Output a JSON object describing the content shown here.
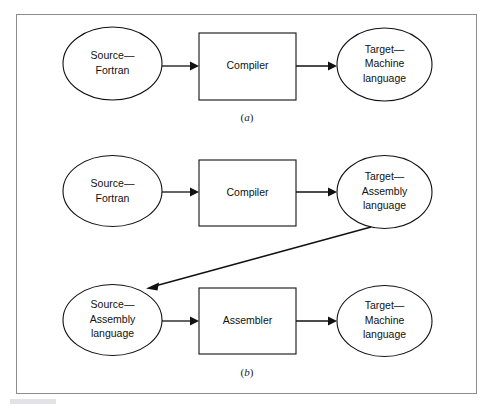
{
  "figure": {
    "background_color": "#ffffff",
    "frame_color": "#8c8c90",
    "stroke_color": "#111111",
    "panels": [
      {
        "id": "panel-a",
        "caption_open": "(",
        "caption_letter": "a",
        "caption_close": ")",
        "nodes": [
          {
            "id": "a-source",
            "shape": "ellipse",
            "role": "source",
            "lines": [
              "Source—",
              "Fortran"
            ]
          },
          {
            "id": "a-processor",
            "shape": "rectangle",
            "role": "translator",
            "lines": [
              "Compiler"
            ]
          },
          {
            "id": "a-target",
            "shape": "ellipse",
            "role": "target",
            "lines": [
              "Target—",
              "Machine",
              "language"
            ]
          }
        ],
        "edges": [
          {
            "id": "a-edge-1",
            "from": "a-source",
            "to": "a-processor",
            "style": "arrow"
          },
          {
            "id": "a-edge-2",
            "from": "a-processor",
            "to": "a-target",
            "style": "arrow"
          }
        ]
      },
      {
        "id": "panel-b",
        "caption_open": "(",
        "caption_letter": "b",
        "caption_close": ")",
        "nodes": [
          {
            "id": "b-source-fortran",
            "shape": "ellipse",
            "role": "source",
            "lines": [
              "Source—",
              "Fortran"
            ]
          },
          {
            "id": "b-compiler",
            "shape": "rectangle",
            "role": "translator",
            "lines": [
              "Compiler"
            ]
          },
          {
            "id": "b-target-assembly",
            "shape": "ellipse",
            "role": "target",
            "lines": [
              "Target—",
              "Assembly",
              "language"
            ]
          },
          {
            "id": "b-source-assembly",
            "shape": "ellipse",
            "role": "source",
            "lines": [
              "Source—",
              "Assembly",
              "language"
            ]
          },
          {
            "id": "b-assembler",
            "shape": "rectangle",
            "role": "translator",
            "lines": [
              "Assembler"
            ]
          },
          {
            "id": "b-target-machine",
            "shape": "ellipse",
            "role": "target",
            "lines": [
              "Target—",
              "Machine",
              "language"
            ]
          }
        ],
        "edges": [
          {
            "id": "b-edge-1",
            "from": "b-source-fortran",
            "to": "b-compiler",
            "style": "arrow"
          },
          {
            "id": "b-edge-2",
            "from": "b-compiler",
            "to": "b-target-assembly",
            "style": "arrow"
          },
          {
            "id": "b-edge-3",
            "from": "b-target-assembly",
            "to": "b-source-assembly",
            "style": "arrow-diagonal"
          },
          {
            "id": "b-edge-4",
            "from": "b-source-assembly",
            "to": "b-assembler",
            "style": "arrow"
          },
          {
            "id": "b-edge-5",
            "from": "b-assembler",
            "to": "b-target-machine",
            "style": "arrow"
          }
        ]
      }
    ]
  }
}
